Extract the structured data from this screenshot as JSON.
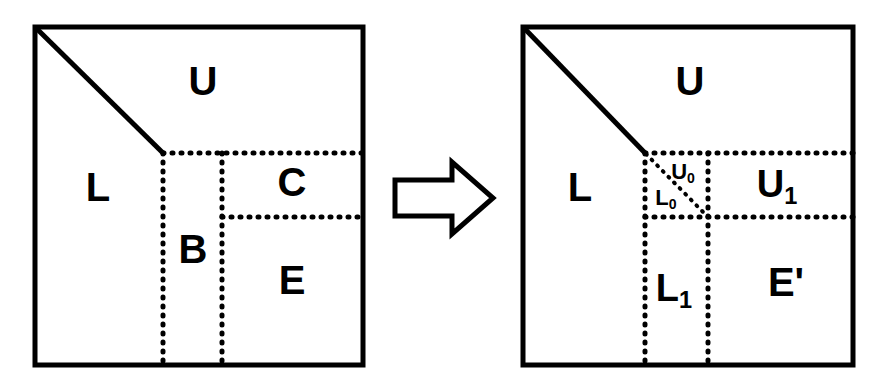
{
  "figure": {
    "background_color": "#ffffff",
    "line_color": "#000000",
    "panels": [
      {
        "id": "before",
        "name": "before-panel",
        "square_bounds": {
          "x": 35,
          "y": 27,
          "width": 328,
          "height": 338
        },
        "diagonal": {
          "from": [
            35,
            27
          ],
          "to": [
            163,
            153
          ],
          "style": "solid"
        },
        "dotted_lines": [
          {
            "name": "horizontal-upper",
            "from": [
              163,
              153
            ],
            "to": [
              363,
              153
            ]
          },
          {
            "name": "horizontal-lower",
            "from": [
              222,
              217
            ],
            "to": [
              363,
              217
            ]
          },
          {
            "name": "vertical-left",
            "from": [
              163,
              153
            ],
            "to": [
              163,
              365
            ]
          },
          {
            "name": "vertical-right",
            "from": [
              222,
              153
            ],
            "to": [
              222,
              365
            ]
          }
        ],
        "labels": [
          {
            "name": "label-U",
            "text": "U",
            "x": 203,
            "y": 84,
            "size": "xl"
          },
          {
            "name": "label-L",
            "text": "L",
            "x": 98,
            "y": 190,
            "size": "xl"
          },
          {
            "name": "label-B",
            "text": "B",
            "x": 193,
            "y": 252,
            "size": "xl"
          },
          {
            "name": "label-C",
            "text": "C",
            "x": 292,
            "y": 185,
            "size": "xl"
          },
          {
            "name": "label-E",
            "text": "E",
            "x": 292,
            "y": 283,
            "size": "xl"
          }
        ]
      },
      {
        "id": "after",
        "name": "after-panel",
        "square_bounds": {
          "x": 523,
          "y": 27,
          "width": 330,
          "height": 338
        },
        "diagonal": {
          "from": [
            523,
            27
          ],
          "to": [
            645,
            153
          ],
          "style": "solid"
        },
        "inner_diagonal": {
          "from": [
            645,
            153
          ],
          "to": [
            708,
            217
          ],
          "style": "dotted"
        },
        "dotted_lines": [
          {
            "name": "horizontal-upper",
            "from": [
              645,
              153
            ],
            "to": [
              853,
              153
            ]
          },
          {
            "name": "horizontal-lower",
            "from": [
              645,
              217
            ],
            "to": [
              853,
              217
            ]
          },
          {
            "name": "vertical-left",
            "from": [
              645,
              153
            ],
            "to": [
              645,
              365
            ]
          },
          {
            "name": "vertical-right",
            "from": [
              708,
              153
            ],
            "to": [
              708,
              365
            ]
          }
        ],
        "labels": [
          {
            "name": "label-U",
            "text": "U",
            "x": 690,
            "y": 84,
            "size": "xl"
          },
          {
            "name": "label-L",
            "text": "L",
            "x": 580,
            "y": 190,
            "size": "xl"
          },
          {
            "name": "label-U0",
            "text": "U",
            "sub": "0",
            "x": 683,
            "y": 173,
            "size": "sm"
          },
          {
            "name": "label-L0",
            "text": "L",
            "sub": "0",
            "x": 666,
            "y": 199,
            "size": "sm"
          },
          {
            "name": "label-U1",
            "text": "U",
            "sub": "1",
            "x": 777,
            "y": 187,
            "size": "lg"
          },
          {
            "name": "label-L1",
            "text": "L",
            "sub": "1",
            "x": 674,
            "y": 291,
            "size": "lg"
          },
          {
            "name": "label-Eprime",
            "text": "E'",
            "x": 786,
            "y": 285,
            "size": "xl"
          }
        ]
      }
    ],
    "arrow": {
      "name": "transform-arrow",
      "direction": "right",
      "style": "hollow-outline",
      "bounds": {
        "x": 395,
        "y": 162,
        "width": 98,
        "height": 72
      }
    }
  }
}
